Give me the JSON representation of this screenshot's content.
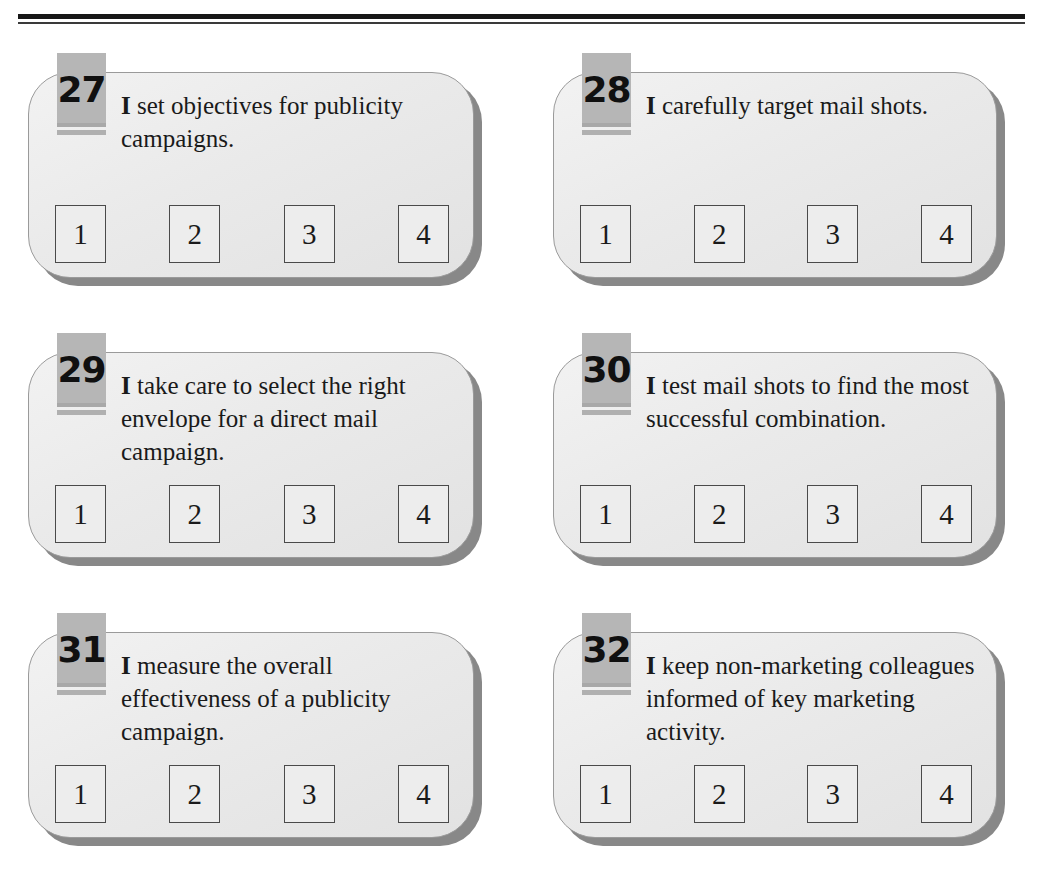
{
  "page": {
    "header_rule": "double-rule",
    "background_color": "#ffffff",
    "card_fill_color": "#eaeaea",
    "card_shadow_color": "#888888",
    "badge_color": "#b6b6b6",
    "text_color": "#1a1a1a"
  },
  "answer_options": [
    "1",
    "2",
    "3",
    "4"
  ],
  "questions": [
    {
      "number": "27",
      "lead": "I",
      "text": " set objectives for publicity campaigns.",
      "options": [
        "1",
        "2",
        "3",
        "4"
      ]
    },
    {
      "number": "28",
      "lead": "I",
      "text": " carefully target mail shots.",
      "options": [
        "1",
        "2",
        "3",
        "4"
      ]
    },
    {
      "number": "29",
      "lead": "I",
      "text": " take care to select the right envelope for a direct mail campaign.",
      "options": [
        "1",
        "2",
        "3",
        "4"
      ]
    },
    {
      "number": "30",
      "lead": "I",
      "text": " test mail shots to find the most successful combination.",
      "options": [
        "1",
        "2",
        "3",
        "4"
      ]
    },
    {
      "number": "31",
      "lead": "I",
      "text": " measure the overall effectiveness of a publicity campaign.",
      "options": [
        "1",
        "2",
        "3",
        "4"
      ]
    },
    {
      "number": "32",
      "lead": "I",
      "text": " keep non-marketing colleagues informed of key marketing activity.",
      "options": [
        "1",
        "2",
        "3",
        "4"
      ]
    }
  ]
}
